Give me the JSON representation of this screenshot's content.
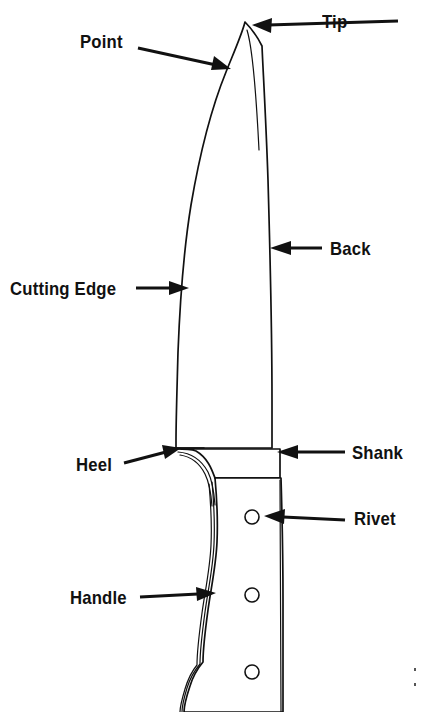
{
  "diagram": {
    "background_color": "#ffffff",
    "line_color": "#111111",
    "width": 422,
    "height": 712
  },
  "labels": {
    "tip": "Tip",
    "point": "Point",
    "back": "Back",
    "cutting_edge": "Cutting  Edge",
    "heel": "Heel",
    "shank": "Shank",
    "rivet": "Rivet",
    "handle": "Handle"
  },
  "parts": [
    {
      "id": "tip",
      "label": "Tip",
      "label_x": 322,
      "label_y": 12,
      "align": "left",
      "arrow_from_x": 398,
      "arrow_from_y": 21,
      "arrow_to_x": 252,
      "arrow_to_y": 25
    },
    {
      "id": "point",
      "label": "Point",
      "label_x": 80,
      "label_y": 32,
      "align": "left",
      "arrow_from_x": 138,
      "arrow_from_y": 48,
      "arrow_to_x": 229,
      "arrow_to_y": 69
    },
    {
      "id": "back",
      "label": "Back",
      "label_x": 330,
      "label_y": 239,
      "align": "left",
      "arrow_from_x": 322,
      "arrow_from_y": 248,
      "arrow_to_x": 271,
      "arrow_to_y": 248
    },
    {
      "id": "cutting-edge",
      "label": "Cutting  Edge",
      "label_x": 10,
      "label_y": 279,
      "align": "left",
      "arrow_from_x": 138,
      "arrow_from_y": 288,
      "arrow_to_x": 187,
      "arrow_to_y": 288
    },
    {
      "id": "heel",
      "label": "Heel",
      "label_x": 76,
      "label_y": 455,
      "align": "left",
      "arrow_from_x": 124,
      "arrow_from_y": 463,
      "arrow_to_x": 180,
      "arrow_to_y": 449
    },
    {
      "id": "shank",
      "label": "Shank",
      "label_x": 352,
      "label_y": 443,
      "align": "left",
      "arrow_from_x": 345,
      "arrow_from_y": 452,
      "arrow_to_x": 277,
      "arrow_to_y": 452
    },
    {
      "id": "rivet",
      "label": "Rivet",
      "label_x": 354,
      "label_y": 509,
      "align": "left",
      "arrow_from_x": 345,
      "arrow_from_y": 520,
      "arrow_to_x": 265,
      "arrow_to_y": 515
    },
    {
      "id": "handle",
      "label": "Handle",
      "label_x": 70,
      "label_y": 588,
      "align": "left",
      "arrow_from_x": 140,
      "arrow_from_y": 597,
      "arrow_to_x": 215,
      "arrow_to_y": 594
    }
  ],
  "rivets": [
    {
      "cx": 252,
      "cy": 517,
      "r": 7
    },
    {
      "cx": 252,
      "cy": 595,
      "r": 7
    },
    {
      "cx": 252,
      "cy": 672,
      "r": 7
    }
  ],
  "geometry": {
    "tip_point": {
      "x": 245,
      "y": 22
    },
    "heel_point": {
      "x": 176,
      "y": 448
    },
    "blade_spine_top_x": 262,
    "blade_spine_heel_x": 272,
    "bolster_right_x": 280,
    "handle_bottom_y": 712
  }
}
